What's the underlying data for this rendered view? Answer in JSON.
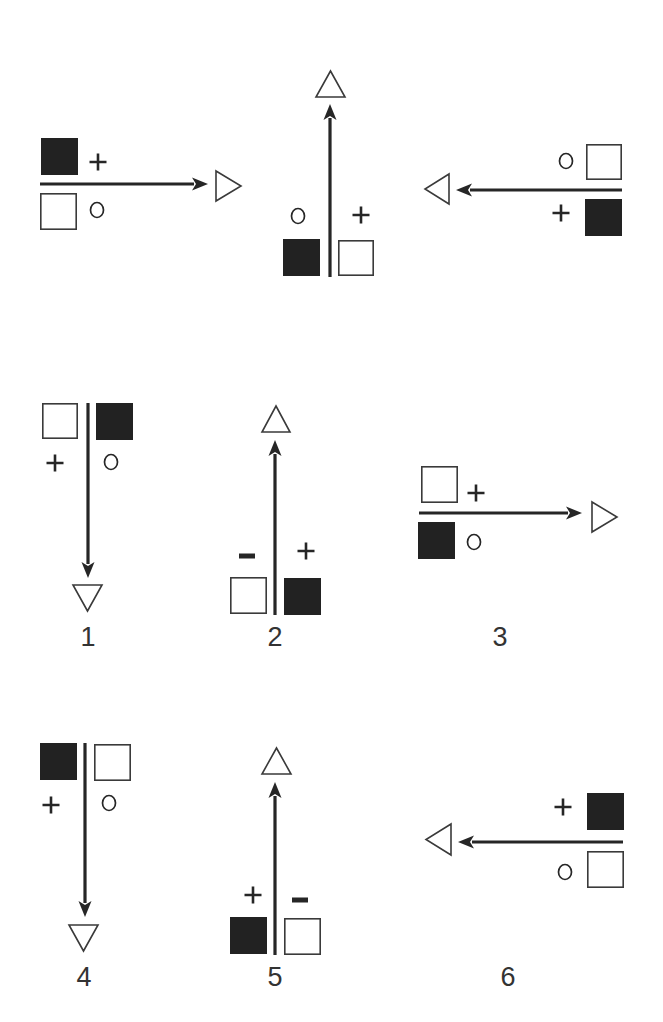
{
  "colors": {
    "ink": "#262626",
    "filled": "#222222",
    "outline": "#3a3a3a",
    "background": "#ffffff"
  },
  "panels": [
    {
      "id": "top-left",
      "label": "",
      "arrow": {
        "x1": 40,
        "y1": 184,
        "x2": 208,
        "y2": 184,
        "direction": "right"
      },
      "goal_triangle": {
        "direction": "right",
        "x": 216,
        "y": 171,
        "w": 25,
        "h": 30
      },
      "squares": [
        {
          "fill": "filled",
          "x": 41,
          "y": 138,
          "size": 37
        },
        {
          "fill": "empty",
          "x": 40,
          "y": 193,
          "size": 37
        }
      ],
      "marks": [
        {
          "symbol": "+",
          "x": 98,
          "y": 162
        },
        {
          "symbol": "o",
          "x": 97,
          "y": 210
        }
      ]
    },
    {
      "id": "top-center",
      "label": "",
      "arrow": {
        "x1": 330,
        "y1": 277,
        "x2": 330,
        "y2": 104,
        "direction": "up"
      },
      "goal_triangle": {
        "direction": "up",
        "x": 316,
        "y": 71,
        "w": 29,
        "h": 26
      },
      "squares": [
        {
          "fill": "filled",
          "x": 283,
          "y": 239,
          "size": 37
        },
        {
          "fill": "empty",
          "x": 338,
          "y": 240,
          "size": 36
        }
      ],
      "marks": [
        {
          "symbol": "o",
          "x": 298,
          "y": 216
        },
        {
          "symbol": "+",
          "x": 361,
          "y": 215
        }
      ]
    },
    {
      "id": "top-right",
      "label": "",
      "arrow": {
        "x1": 622,
        "y1": 190,
        "x2": 456,
        "y2": 190,
        "direction": "left"
      },
      "goal_triangle": {
        "direction": "left",
        "x": 425,
        "y": 174,
        "w": 24,
        "h": 30
      },
      "squares": [
        {
          "fill": "empty",
          "x": 586,
          "y": 144,
          "size": 36
        },
        {
          "fill": "filled",
          "x": 585,
          "y": 199,
          "size": 37
        }
      ],
      "marks": [
        {
          "symbol": "o",
          "x": 566,
          "y": 161
        },
        {
          "symbol": "+",
          "x": 561,
          "y": 213
        }
      ]
    },
    {
      "id": "panel-1",
      "label": "1",
      "label_pos": {
        "x": 88,
        "y": 646
      },
      "arrow": {
        "x1": 88,
        "y1": 403,
        "x2": 88,
        "y2": 578,
        "direction": "down"
      },
      "goal_triangle": {
        "direction": "down",
        "x": 73,
        "y": 585,
        "w": 29,
        "h": 26
      },
      "squares": [
        {
          "fill": "empty",
          "x": 42,
          "y": 403,
          "size": 36
        },
        {
          "fill": "filled",
          "x": 96,
          "y": 403,
          "size": 37
        }
      ],
      "marks": [
        {
          "symbol": "+",
          "x": 55,
          "y": 463
        },
        {
          "symbol": "o",
          "x": 111,
          "y": 462
        }
      ]
    },
    {
      "id": "panel-2",
      "label": "2",
      "label_pos": {
        "x": 275,
        "y": 646
      },
      "arrow": {
        "x1": 275,
        "y1": 615,
        "x2": 275,
        "y2": 440,
        "direction": "up"
      },
      "goal_triangle": {
        "direction": "up",
        "x": 262,
        "y": 406,
        "w": 28,
        "h": 26
      },
      "squares": [
        {
          "fill": "empty",
          "x": 230,
          "y": 577,
          "size": 37
        },
        {
          "fill": "filled",
          "x": 284,
          "y": 578,
          "size": 37
        }
      ],
      "marks": [
        {
          "symbol": "-",
          "x": 247,
          "y": 556
        },
        {
          "symbol": "+",
          "x": 306,
          "y": 551
        }
      ]
    },
    {
      "id": "panel-3",
      "label": "3",
      "label_pos": {
        "x": 500,
        "y": 646
      },
      "arrow": {
        "x1": 419,
        "y1": 513,
        "x2": 582,
        "y2": 513,
        "direction": "right"
      },
      "goal_triangle": {
        "direction": "right",
        "x": 592,
        "y": 502,
        "w": 25,
        "h": 30
      },
      "squares": [
        {
          "fill": "empty",
          "x": 421,
          "y": 466,
          "size": 37
        },
        {
          "fill": "filled",
          "x": 418,
          "y": 522,
          "size": 37
        }
      ],
      "marks": [
        {
          "symbol": "+",
          "x": 476,
          "y": 493
        },
        {
          "symbol": "o",
          "x": 474,
          "y": 542
        }
      ]
    },
    {
      "id": "panel-4",
      "label": "4",
      "label_pos": {
        "x": 84,
        "y": 986
      },
      "arrow": {
        "x1": 85,
        "y1": 743,
        "x2": 85,
        "y2": 917,
        "direction": "down"
      },
      "goal_triangle": {
        "direction": "down",
        "x": 69,
        "y": 925,
        "w": 29,
        "h": 26
      },
      "squares": [
        {
          "fill": "filled",
          "x": 40,
          "y": 743,
          "size": 37
        },
        {
          "fill": "empty",
          "x": 94,
          "y": 744,
          "size": 37
        }
      ],
      "marks": [
        {
          "symbol": "+",
          "x": 51,
          "y": 805
        },
        {
          "symbol": "o",
          "x": 109,
          "y": 803
        }
      ]
    },
    {
      "id": "panel-5",
      "label": "5",
      "label_pos": {
        "x": 275,
        "y": 986
      },
      "arrow": {
        "x1": 275,
        "y1": 955,
        "x2": 275,
        "y2": 782,
        "direction": "up"
      },
      "goal_triangle": {
        "direction": "up",
        "x": 262,
        "y": 748,
        "w": 29,
        "h": 26
      },
      "squares": [
        {
          "fill": "filled",
          "x": 230,
          "y": 917,
          "size": 37
        },
        {
          "fill": "empty",
          "x": 284,
          "y": 918,
          "size": 37
        }
      ],
      "marks": [
        {
          "symbol": "+",
          "x": 253,
          "y": 895
        },
        {
          "symbol": "-",
          "x": 300,
          "y": 900
        }
      ]
    },
    {
      "id": "panel-6",
      "label": "6",
      "label_pos": {
        "x": 508,
        "y": 986
      },
      "arrow": {
        "x1": 623,
        "y1": 842,
        "x2": 458,
        "y2": 842,
        "direction": "left"
      },
      "goal_triangle": {
        "direction": "left",
        "x": 426,
        "y": 824,
        "w": 25,
        "h": 31
      },
      "squares": [
        {
          "fill": "filled",
          "x": 587,
          "y": 793,
          "size": 37
        },
        {
          "fill": "empty",
          "x": 587,
          "y": 851,
          "size": 37
        }
      ],
      "marks": [
        {
          "symbol": "+",
          "x": 563,
          "y": 807
        },
        {
          "symbol": "o",
          "x": 565,
          "y": 872
        }
      ]
    }
  ]
}
